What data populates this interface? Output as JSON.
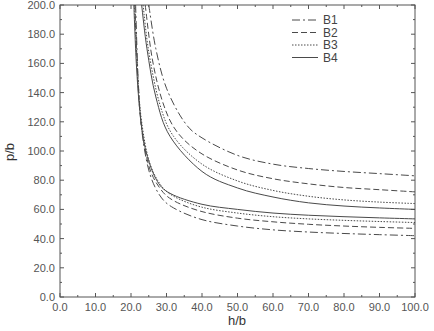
{
  "chart_data": {
    "type": "line",
    "title": "",
    "xlabel": "h/b",
    "ylabel": "p/b",
    "xlim": [
      0,
      100
    ],
    "ylim": [
      0,
      200
    ],
    "xticks": [
      "0.0",
      "10.0",
      "20.0",
      "30.0",
      "40.0",
      "50.0",
      "60.0",
      "70.0",
      "80.0",
      "90.0",
      "100.0"
    ],
    "yticks": [
      "0.0",
      "20.0",
      "40.0",
      "60.0",
      "80.0",
      "100.0",
      "120.0",
      "140.0",
      "160.0",
      "180.0",
      "200.0"
    ],
    "grid": false,
    "legend_position": "upper right",
    "legend": [
      {
        "name": "B1",
        "style": "dashdot"
      },
      {
        "name": "B2",
        "style": "dashed"
      },
      {
        "name": "B3",
        "style": "dotted"
      },
      {
        "name": "B4",
        "style": "solid"
      }
    ],
    "series": [
      {
        "name": "B1",
        "branch": "upper",
        "style": "dashdot",
        "x": [
          25.0,
          27.0,
          30.0,
          35.0,
          40.0,
          50.0,
          60.0,
          70.0,
          80.0,
          90.0,
          100.0
        ],
        "y": [
          200.0,
          170.0,
          143.0,
          120.0,
          109.0,
          97.0,
          91.0,
          88.0,
          86.0,
          84.5,
          83.0
        ]
      },
      {
        "name": "B1",
        "branch": "lower",
        "style": "dashdot",
        "x": [
          21.3,
          22.0,
          23.0,
          25.0,
          28.0,
          32.0,
          40.0,
          50.0,
          60.0,
          70.0,
          80.0,
          90.0,
          100.0
        ],
        "y": [
          200.0,
          150.0,
          115.0,
          87.0,
          70.0,
          61.0,
          53.0,
          48.6,
          46.0,
          44.5,
          43.5,
          42.7,
          42.0
        ]
      },
      {
        "name": "B2",
        "branch": "upper",
        "style": "dashed",
        "x": [
          24.0,
          26.0,
          29.0,
          33.0,
          40.0,
          50.0,
          60.0,
          70.0,
          80.0,
          90.0,
          100.0
        ],
        "y": [
          200.0,
          163.0,
          133.0,
          113.0,
          98.0,
          87.0,
          81.0,
          77.5,
          75.0,
          73.5,
          72.0
        ]
      },
      {
        "name": "B2",
        "branch": "lower",
        "style": "dashed",
        "x": [
          21.1,
          22.0,
          23.0,
          25.0,
          28.0,
          32.0,
          40.0,
          50.0,
          60.0,
          70.0,
          80.0,
          90.0,
          100.0
        ],
        "y": [
          200.0,
          145.0,
          116.0,
          90.0,
          75.0,
          66.0,
          58.5,
          54.0,
          51.5,
          49.8,
          48.6,
          47.7,
          47.0
        ]
      },
      {
        "name": "B3",
        "branch": "upper",
        "style": "dotted",
        "x": [
          23.4,
          25.0,
          28.0,
          32.0,
          40.0,
          50.0,
          60.0,
          70.0,
          80.0,
          90.0,
          100.0
        ],
        "y": [
          200.0,
          168.0,
          133.0,
          110.0,
          91.0,
          79.5,
          73.0,
          69.0,
          66.5,
          65.0,
          64.0
        ]
      },
      {
        "name": "B3",
        "branch": "lower",
        "style": "dotted",
        "x": [
          21.0,
          22.0,
          23.0,
          25.0,
          28.0,
          32.0,
          40.0,
          50.0,
          60.0,
          70.0,
          80.0,
          90.0,
          100.0
        ],
        "y": [
          200.0,
          148.0,
          120.0,
          94.0,
          78.0,
          69.0,
          61.5,
          57.5,
          55.0,
          53.5,
          52.5,
          51.7,
          51.0
        ]
      },
      {
        "name": "B4",
        "branch": "upper",
        "style": "solid",
        "x": [
          23.0,
          24.5,
          27.0,
          31.0,
          40.0,
          50.0,
          60.0,
          70.0,
          80.0,
          90.0,
          100.0
        ],
        "y": [
          200.0,
          170.0,
          137.0,
          110.0,
          86.0,
          74.7,
          68.5,
          64.5,
          62.3,
          61.0,
          60.0
        ]
      },
      {
        "name": "B4",
        "branch": "lower",
        "style": "solid",
        "x": [
          20.8,
          21.5,
          22.5,
          24.0,
          27.0,
          31.0,
          40.0,
          50.0,
          60.0,
          70.0,
          80.0,
          90.0,
          100.0
        ],
        "y": [
          200.0,
          160.0,
          127.0,
          102.0,
          81.0,
          71.0,
          63.5,
          60.0,
          57.5,
          56.0,
          55.0,
          54.2,
          53.5
        ]
      }
    ]
  }
}
